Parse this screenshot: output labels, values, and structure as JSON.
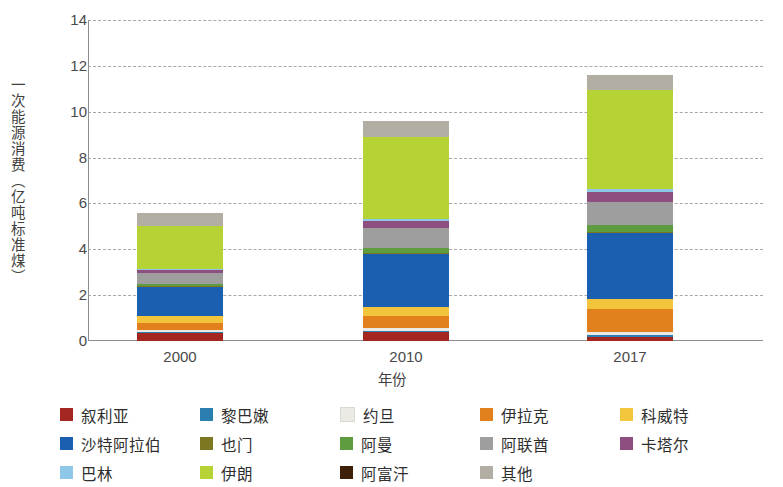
{
  "chart_data": {
    "type": "bar",
    "subtype": "stacked-bar",
    "title": "",
    "xlabel": "年份",
    "ylabel": "一次能源消费（亿吨标准煤）",
    "categories": [
      "2000",
      "2010",
      "2017"
    ],
    "ylim": [
      0,
      14
    ],
    "yticks": [
      0,
      2,
      4,
      6,
      8,
      10,
      12,
      14
    ],
    "grid": true,
    "legend_position": "bottom",
    "units": "亿吨标准煤",
    "series": [
      {
        "name": "叙利亚",
        "color": "#a32620",
        "values": [
          0.33,
          0.38,
          0.18
        ]
      },
      {
        "name": "黎巴嫩",
        "color": "#2b7eb0",
        "values": [
          0.05,
          0.07,
          0.09
        ]
      },
      {
        "name": "约旦",
        "color": "#eceae4",
        "values": [
          0.08,
          0.12,
          0.13
        ]
      },
      {
        "name": "伊拉克",
        "color": "#e2801e",
        "values": [
          0.33,
          0.52,
          1.0
        ]
      },
      {
        "name": "科威特",
        "color": "#f0c githubusercontent",
        "values": [
          0.3,
          0.4,
          0.45
        ]
      },
      {
        "name": "沙特阿拉伯",
        "color": "#1a5fb0",
        "values": [
          1.26,
          2.3,
          2.85
        ]
      },
      {
        "name": "也门",
        "color": "#7c7721",
        "values": [
          0.05,
          0.07,
          0.05
        ]
      },
      {
        "name": "阿曼",
        "color": "#5f9b3f",
        "values": [
          0.11,
          0.21,
          0.31
        ]
      },
      {
        "name": "阿联酋",
        "color": "#9e9e9e",
        "values": [
          0.48,
          0.84,
          1.0
        ]
      },
      {
        "name": "卡塔尔",
        "color": "#8e4f80",
        "values": [
          0.1,
          0.32,
          0.45
        ]
      },
      {
        "name": "巴林",
        "color": "#8fc7e8",
        "values": [
          0.06,
          0.11,
          0.13
        ]
      },
      {
        "name": "伊朗",
        "color": "#b5d334",
        "values": [
          1.86,
          3.55,
          4.3
        ]
      },
      {
        "name": "阿富汗",
        "color": "#3e2008",
        "values": [
          0.01,
          0.02,
          0.03
        ]
      },
      {
        "name": "其他",
        "color": "#b3aea4",
        "values": [
          0.56,
          0.67,
          0.63
        ]
      }
    ],
    "totals": [
      5.58,
      9.58,
      11.6
    ]
  },
  "legend": {
    "items": [
      {
        "label": "叙利亚",
        "color": "#a32620"
      },
      {
        "label": "黎巴嫩",
        "color": "#2b7eb0"
      },
      {
        "label": "约旦",
        "color": "#eceae4"
      },
      {
        "label": "伊拉克",
        "color": "#e2801e"
      },
      {
        "label": "科威特",
        "color": "#f2c53d"
      },
      {
        "label": "沙特阿拉伯",
        "color": "#1a5fb0"
      },
      {
        "label": "也门",
        "color": "#7c7721"
      },
      {
        "label": "阿曼",
        "color": "#5f9b3f"
      },
      {
        "label": "阿联酋",
        "color": "#9e9e9e"
      },
      {
        "label": "卡塔尔",
        "color": "#8e4f80"
      },
      {
        "label": "巴林",
        "color": "#8fc7e8"
      },
      {
        "label": "伊朗",
        "color": "#b5d334"
      },
      {
        "label": "阿富汗",
        "color": "#3e2008"
      },
      {
        "label": "其他",
        "color": "#b3aea4"
      }
    ]
  },
  "axes": {
    "y_title": "一次能源消费（亿吨标准煤）",
    "x_title": "年份",
    "y_tick_labels": [
      "0",
      "2",
      "4",
      "6",
      "8",
      "10",
      "12",
      "14"
    ],
    "x_tick_labels": [
      "2000",
      "2010",
      "2017"
    ]
  },
  "colors": {
    "grid": "#9a9a9a",
    "axis": "#8d8d8d",
    "text": "#3f3f3f",
    "background": "#ffffff"
  }
}
